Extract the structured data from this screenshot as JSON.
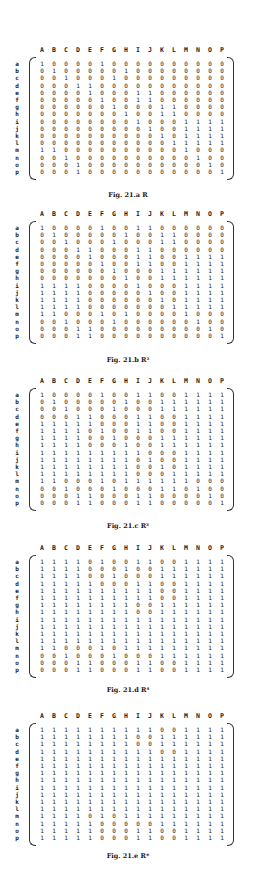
{
  "columns": [
    "A",
    "B",
    "C",
    "D",
    "E",
    "F",
    "G",
    "H",
    "I",
    "J",
    "K",
    "L",
    "M",
    "N",
    "O",
    "P"
  ],
  "row_labels": [
    "a",
    "b",
    "c",
    "d",
    "e",
    "f",
    "g",
    "h",
    "i",
    "j",
    "k",
    "l",
    "m",
    "n",
    "o",
    "p"
  ],
  "figures": [
    {
      "caption": "Fig. 21.a  R",
      "matrix": [
        "1000010000000000",
        "0100000100000000",
        "0010001000000000",
        "0001100000000000",
        "0000100011000000",
        "0000010011000000",
        "0000001000110000",
        "0000000100110000",
        "0000000010001111",
        "0000000001001111",
        "0000000000101111",
        "0000000000011111",
        "1100000000001000",
        "0010000000000100",
        "0001000000000010",
        "0001000000000001"
      ]
    },
    {
      "caption": "Fig. 21.b  R²",
      "matrix": [
        "1000010011000000",
        "0100000100110000",
        "0010001000110000",
        "0001100011000000",
        "0000100011001111",
        "0000010011001111",
        "0000001000111111",
        "0000000100111111",
        "1111000010001111",
        "1111000001001111",
        "1111000000101111",
        "1111000000011111",
        "1100010100001000",
        "0010001000000100",
        "0001100000000010",
        "0001100000000001"
      ]
    },
    {
      "caption": "Fig. 21.c  R³",
      "matrix": [
        "1000010011001111",
        "0100000100111111",
        "0010001000111111",
        "0001100011001111",
        "1111100011001111",
        "1111010011001111",
        "1111001000111111",
        "1111000100111111",
        "1111111110001111",
        "1111111101001111",
        "1111111100101111",
        "1111111100011111",
        "1100010111111000",
        "0010001000110100",
        "0001100011000010",
        "0001100011000001"
      ]
    },
    {
      "caption": "Fig. 21.d  R⁴",
      "matrix": [
        "1111010011001111",
        "1111000100111111",
        "1111001000111111",
        "1111100011001111",
        "1111111111001111",
        "1111111111001111",
        "1111111100111111",
        "1111111100111111",
        "1111111111111111",
        "1111111111111111",
        "1111111111111111",
        "1111111111111111",
        "1100010111111111",
        "0010001000111111",
        "0001100011001111",
        "0001100011001111"
      ]
    },
    {
      "caption": "Fig. 21.e  R*",
      "matrix": [
        "1111111111001111",
        "1111111100111111",
        "1111111100111111",
        "1111111111001111",
        "1111111111111111",
        "1111111111111111",
        "1111111111111111",
        "1111111111111111",
        "1111111111111111",
        "1111111111111111",
        "1111111111111111",
        "1111111111111111",
        "1111010111111111",
        "1111100000111111",
        "1111100011001111",
        "1111100011001111"
      ]
    }
  ],
  "layout": {
    "fig_tops": [
      46,
      210,
      377,
      544,
      712
    ],
    "caption_offsets": [
      145,
      146,
      145,
      142,
      140
    ]
  }
}
